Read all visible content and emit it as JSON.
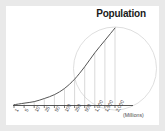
{
  "chart_data": {
    "type": "line",
    "title": "Population",
    "xlabel": "(Millions)",
    "ylabel": "",
    "categories": [
      "1",
      "5",
      "10",
      "25",
      "50",
      "100",
      "250",
      "500",
      "1,000",
      "1,500",
      "2,000"
    ],
    "values": [
      1,
      3,
      5,
      9,
      14,
      22,
      34,
      50,
      68,
      84,
      100
    ],
    "x": [
      1,
      5,
      10,
      25,
      50,
      100,
      250,
      500,
      1000,
      1500,
      2000
    ],
    "ylim": [
      0,
      100
    ],
    "grid": true,
    "gridlines": "vertical drop lines from curve to x-axis at each category",
    "legend": "none",
    "annotations": [
      {
        "name": "background-circle",
        "shape": "circle",
        "stroke": "#d6d6d6",
        "fill": "none"
      }
    ],
    "curve_color": "#555555",
    "axis_color": "#444444",
    "gridline_color": "#c9c9c9"
  },
  "figure": {
    "title": "Population",
    "unit_label": "(Millions)",
    "tick_labels": [
      "1",
      "5",
      "10",
      "25",
      "50",
      "100",
      "250",
      "500",
      "1,000",
      "1,500",
      "2,000"
    ]
  },
  "colors": {
    "background": "#ffffff",
    "frame": "#e9e9e9",
    "title_text": "#1a1a1a",
    "tick_text": "#3c3c3c",
    "curve": "#555555",
    "axis": "#444444",
    "gridline": "#c9c9c9",
    "circle": "#d6d6d6"
  }
}
